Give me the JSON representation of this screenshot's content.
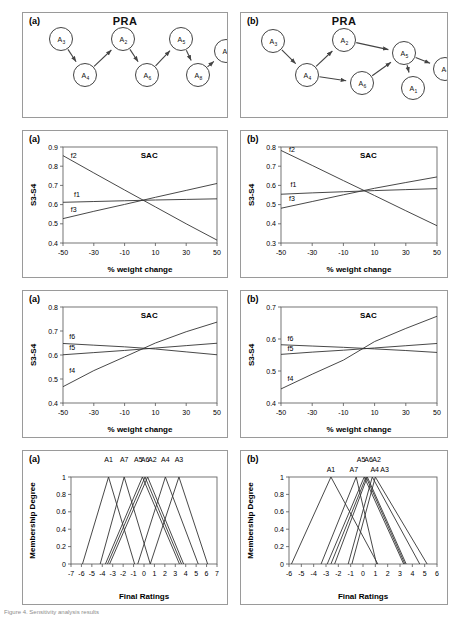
{
  "figure": {
    "caption": "Figure 4. Sensitivity analysis results"
  },
  "panels": {
    "pra_a": {
      "tag": "(a)",
      "title": "PRA",
      "nodes": [
        {
          "id": "A3",
          "label": "A",
          "sub": "3",
          "x": 38,
          "y": 26
        },
        {
          "id": "A4",
          "label": "A",
          "sub": "4",
          "x": 62,
          "y": 62
        },
        {
          "id": "A2",
          "label": "A",
          "sub": "2",
          "x": 100,
          "y": 26
        },
        {
          "id": "A6",
          "label": "A",
          "sub": "6",
          "x": 124,
          "y": 62
        },
        {
          "id": "A5",
          "label": "A",
          "sub": "5",
          "x": 158,
          "y": 26
        },
        {
          "id": "A8",
          "label": "A",
          "sub": "8",
          "x": 175,
          "y": 62
        },
        {
          "id": "A1",
          "label": "A",
          "sub": "1",
          "x": 203,
          "y": 38
        }
      ],
      "edges": [
        {
          "from": "A3",
          "to": "A4"
        },
        {
          "from": "A4",
          "to": "A2"
        },
        {
          "from": "A2",
          "to": "A6"
        },
        {
          "from": "A6",
          "to": "A5"
        },
        {
          "from": "A5",
          "to": "A8"
        },
        {
          "from": "A8",
          "to": "A1"
        }
      ]
    },
    "pra_b": {
      "tag": "(b)",
      "title": "PRA",
      "nodes": [
        {
          "id": "A3",
          "label": "A",
          "sub": "3",
          "x": 32,
          "y": 28
        },
        {
          "id": "A4",
          "label": "A",
          "sub": "4",
          "x": 66,
          "y": 62
        },
        {
          "id": "A2",
          "label": "A",
          "sub": "2",
          "x": 103,
          "y": 27
        },
        {
          "id": "A6",
          "label": "A",
          "sub": "6",
          "x": 121,
          "y": 70
        },
        {
          "id": "A5",
          "label": "A",
          "sub": "5",
          "x": 163,
          "y": 40
        },
        {
          "id": "A1",
          "label": "A",
          "sub": "1",
          "x": 172,
          "y": 75
        },
        {
          "id": "A7",
          "label": "A",
          "sub": "7",
          "x": 204,
          "y": 56
        }
      ],
      "edges": [
        {
          "from": "A3",
          "to": "A4"
        },
        {
          "from": "A4",
          "to": "A2"
        },
        {
          "from": "A4",
          "to": "A6"
        },
        {
          "from": "A2",
          "to": "A5"
        },
        {
          "from": "A6",
          "to": "A5"
        },
        {
          "from": "A5",
          "to": "A1"
        },
        {
          "from": "A5",
          "to": "A7"
        }
      ]
    }
  },
  "chart_data": [
    {
      "id": "sac-a-row2",
      "tag": "(a)",
      "type": "line",
      "title": "SAC",
      "xlabel": "% weight change",
      "ylabel": "S3-S4",
      "x": [
        -50,
        -30,
        -10,
        10,
        30,
        50
      ],
      "xticks": [
        "-50",
        "-30",
        "-10",
        "10",
        "30",
        "50"
      ],
      "yticks": [
        "0.4",
        "0.5",
        "0.6",
        "0.7",
        "0.8",
        "0.9"
      ],
      "xlim": [
        -50,
        50
      ],
      "ylim": [
        0.4,
        0.9
      ],
      "grid": false,
      "legend": "inline-labels",
      "series": [
        {
          "name": "f2",
          "values": [
            0.855,
            0.765,
            0.676,
            0.588,
            0.5,
            0.415
          ],
          "label_x": -43,
          "label_y": 0.845
        },
        {
          "name": "f1",
          "values": [
            0.612,
            0.616,
            0.62,
            0.624,
            0.627,
            0.63
          ],
          "label_x": -41,
          "label_y": 0.638
        },
        {
          "name": "f3",
          "values": [
            0.527,
            0.565,
            0.601,
            0.638,
            0.674,
            0.71
          ],
          "label_x": -43,
          "label_y": 0.563
        }
      ]
    },
    {
      "id": "sac-b-row2",
      "tag": "(b)",
      "type": "line",
      "title": "SAC",
      "xlabel": "% weight change",
      "ylabel": "S3-S4",
      "x": [
        -50,
        -30,
        -10,
        10,
        30,
        50
      ],
      "xticks": [
        "-50",
        "-30",
        "-10",
        "10",
        "30",
        "50"
      ],
      "yticks": [
        "0.3",
        "0.4",
        "0.5",
        "0.6",
        "0.7",
        "0.8"
      ],
      "xlim": [
        -50,
        50
      ],
      "ylim": [
        0.3,
        0.8
      ],
      "grid": false,
      "legend": "inline-labels",
      "series": [
        {
          "name": "f2",
          "values": [
            0.782,
            0.704,
            0.625,
            0.547,
            0.468,
            0.39
          ],
          "label_x": -43,
          "label_y": 0.772
        },
        {
          "name": "f1",
          "values": [
            0.554,
            0.561,
            0.567,
            0.573,
            0.578,
            0.583
          ],
          "label_x": -42,
          "label_y": 0.591
        },
        {
          "name": "f3",
          "values": [
            0.481,
            0.516,
            0.551,
            0.585,
            0.615,
            0.644
          ],
          "label_x": -43,
          "label_y": 0.52
        }
      ]
    },
    {
      "id": "sac-a-row3",
      "tag": "(a)",
      "type": "line",
      "title": "SAC",
      "xlabel": "% weight change",
      "ylabel": "S3-S4",
      "x": [
        -50,
        -30,
        -10,
        10,
        30,
        50
      ],
      "xticks": [
        "-50",
        "-30",
        "-10",
        "10",
        "30",
        "50"
      ],
      "yticks": [
        "0.4",
        "0.5",
        "0.6",
        "0.7",
        "0.8"
      ],
      "xlim": [
        -50,
        50
      ],
      "ylim": [
        0.4,
        0.8
      ],
      "grid": false,
      "legend": "inline-labels",
      "series": [
        {
          "name": "f6",
          "values": [
            0.648,
            0.641,
            0.634,
            0.625,
            0.613,
            0.601
          ],
          "label_x": -44,
          "label_y": 0.666
        },
        {
          "name": "f5",
          "values": [
            0.601,
            0.61,
            0.619,
            0.629,
            0.639,
            0.649
          ],
          "label_x": -44,
          "label_y": 0.622
        },
        {
          "name": "f4",
          "values": [
            0.468,
            0.535,
            0.592,
            0.65,
            0.697,
            0.737
          ],
          "label_x": -44,
          "label_y": 0.527
        }
      ]
    },
    {
      "id": "sac-b-row3",
      "tag": "(b)",
      "type": "line",
      "title": "SAC",
      "xlabel": "% weight change",
      "ylabel": "S3-S4",
      "x": [
        -50,
        -30,
        -10,
        10,
        30,
        50
      ],
      "xticks": [
        "-50",
        "-30",
        "-10",
        "10",
        "30",
        "50"
      ],
      "yticks": [
        "0.4",
        "0.5",
        "0.6",
        "0.7"
      ],
      "xlim": [
        -50,
        50
      ],
      "ylim": [
        0.4,
        0.7
      ],
      "grid": false,
      "legend": "inline-labels",
      "series": [
        {
          "name": "f6",
          "values": [
            0.582,
            0.578,
            0.574,
            0.569,
            0.564,
            0.558
          ],
          "label_x": -44,
          "label_y": 0.594
        },
        {
          "name": "f5",
          "values": [
            0.552,
            0.559,
            0.565,
            0.572,
            0.579,
            0.586
          ],
          "label_x": -44,
          "label_y": 0.564
        },
        {
          "name": "f4",
          "values": [
            0.444,
            0.49,
            0.534,
            0.592,
            0.633,
            0.671
          ],
          "label_x": -44,
          "label_y": 0.468
        }
      ]
    },
    {
      "id": "mf-a",
      "tag": "(a)",
      "type": "line",
      "title": "",
      "xlabel": "Final Ratings",
      "ylabel": "Membership Degree",
      "xticks": [
        "-7",
        "-6",
        "-5",
        "-4",
        "-3",
        "-2",
        "-1",
        "0",
        "1",
        "2",
        "3",
        "4",
        "5",
        "6",
        "7"
      ],
      "yticks": [
        "0",
        "0.2",
        "0.4",
        "0.6",
        "0.8",
        "1"
      ],
      "xlim": [
        -7,
        7
      ],
      "ylim": [
        0,
        1
      ],
      "grid": false,
      "legend": "top-labels",
      "series": [
        {
          "name": "A1",
          "peak": -3.4,
          "left": -5.9,
          "right": -0.9,
          "label_x": -3.4,
          "label_row": 0
        },
        {
          "name": "A7",
          "peak": -1.9,
          "left": -4.2,
          "right": 0.6,
          "label_x": -1.9,
          "label_row": 0
        },
        {
          "name": "A5",
          "peak": -0.15,
          "left": -3.7,
          "right": 3.4,
          "label_x": -0.55,
          "label_row": 0
        },
        {
          "name": "A6",
          "peak": 0.1,
          "left": -3.5,
          "right": 3.6,
          "label_x": 0.1,
          "label_row": 0
        },
        {
          "name": "A2",
          "peak": 0.35,
          "left": -3.3,
          "right": 3.8,
          "label_x": 0.8,
          "label_row": 0
        },
        {
          "name": "A4",
          "peak": 2.05,
          "left": -0.6,
          "right": 5.2,
          "label_x": 2.05,
          "label_row": 0
        },
        {
          "name": "A3",
          "peak": 3.35,
          "left": 0.6,
          "right": 6.1,
          "label_x": 3.35,
          "label_row": 0
        }
      ]
    },
    {
      "id": "mf-b",
      "tag": "(b)",
      "type": "line",
      "title": "",
      "xlabel": "Final Ratings",
      "ylabel": "Membership Degree",
      "xticks": [
        "-6",
        "-5",
        "-4",
        "-3",
        "-2",
        "-1",
        "0",
        "1",
        "2",
        "3",
        "4",
        "5",
        "6"
      ],
      "yticks": [
        "0",
        "0.2",
        "0.4",
        "0.6",
        "0.8",
        "1"
      ],
      "xlim": [
        -6,
        6
      ],
      "ylim": [
        0,
        1
      ],
      "grid": false,
      "legend": "top-labels",
      "series": [
        {
          "name": "A1",
          "peak": -2.6,
          "left": -5.8,
          "right": 1.2,
          "label_x": -2.6,
          "label_row": 1
        },
        {
          "name": "A7",
          "peak": -0.55,
          "left": -3.4,
          "right": 1.1,
          "label_x": -0.75,
          "label_row": 1
        },
        {
          "name": "A5",
          "peak": 0.1,
          "left": -2.9,
          "right": 3.3,
          "label_x": -0.15,
          "label_row": 0
        },
        {
          "name": "A6",
          "peak": 0.25,
          "left": -2.6,
          "right": 3.4,
          "label_x": 0.45,
          "label_row": 0
        },
        {
          "name": "A2",
          "peak": 0.35,
          "left": -2.3,
          "right": 3.5,
          "label_x": 1.1,
          "label_row": 0
        },
        {
          "name": "A4",
          "peak": 0.75,
          "left": -1.2,
          "right": 4.6,
          "label_x": 0.95,
          "label_row": 1
        },
        {
          "name": "A3",
          "peak": 1.0,
          "left": -0.9,
          "right": 5.2,
          "label_x": 1.75,
          "label_row": 1
        }
      ]
    }
  ]
}
